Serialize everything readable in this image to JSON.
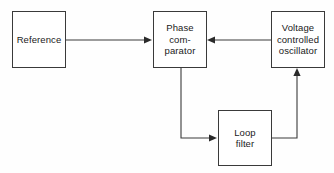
{
  "diagram": {
    "background_color": "#fefefe",
    "line_color": "#3a3a3a",
    "text_color": "#1a1a1a",
    "blocks": [
      {
        "id": "reference",
        "label": "Reference",
        "lines": [
          "Reference"
        ]
      },
      {
        "id": "phase-comparator",
        "label": "Phase comparator",
        "lines": [
          "Phase",
          "com-",
          "parator"
        ]
      },
      {
        "id": "voltage-controlled-oscillator",
        "label": "Voltage controlled oscillator",
        "lines": [
          "Voltage",
          "controlled",
          "oscillator"
        ]
      },
      {
        "id": "loop-filter",
        "label": "Loop filter",
        "lines": [
          "Loop",
          "filter"
        ]
      }
    ],
    "connections": [
      {
        "id": "reference-to-phase-comparator",
        "from": "reference",
        "to": "phase-comparator",
        "direction": "right"
      },
      {
        "id": "vco-to-phase-comparator",
        "from": "voltage-controlled-oscillator",
        "to": "phase-comparator",
        "direction": "left"
      },
      {
        "id": "phase-comparator-to-loop-filter",
        "from": "phase-comparator",
        "to": "loop-filter",
        "direction": "down-right"
      },
      {
        "id": "loop-filter-to-vco",
        "from": "loop-filter",
        "to": "voltage-controlled-oscillator",
        "direction": "right-up"
      }
    ]
  }
}
